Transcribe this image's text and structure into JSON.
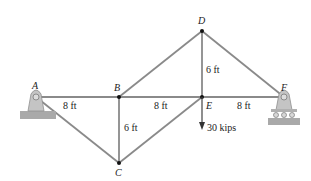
{
  "diagram": {
    "type": "truss",
    "nodes": [
      {
        "id": "A",
        "label": "A",
        "x": 36,
        "y": 97
      },
      {
        "id": "B",
        "label": "B",
        "x": 119,
        "y": 97
      },
      {
        "id": "C",
        "label": "C",
        "x": 119,
        "y": 163
      },
      {
        "id": "D",
        "label": "D",
        "x": 202,
        "y": 31
      },
      {
        "id": "E",
        "label": "E",
        "x": 202,
        "y": 97
      },
      {
        "id": "F",
        "label": "F",
        "x": 284,
        "y": 97
      }
    ],
    "members": [
      [
        "A",
        "B"
      ],
      [
        "B",
        "E"
      ],
      [
        "E",
        "F"
      ],
      [
        "A",
        "C"
      ],
      [
        "B",
        "C"
      ],
      [
        "C",
        "E"
      ],
      [
        "B",
        "D"
      ],
      [
        "D",
        "E"
      ],
      [
        "D",
        "F"
      ]
    ],
    "dimensions": {
      "AB": "8 ft",
      "BE": "8 ft",
      "EF": "8 ft",
      "BC": "6 ft",
      "DE": "6 ft"
    },
    "load": {
      "node": "E",
      "label": "30 kips",
      "direction": "down"
    },
    "supports": {
      "A": "pin",
      "F": "roller"
    },
    "colors": {
      "member": "#8a8a8a",
      "support": "#b9b9b9",
      "ground": "#9c9c9c",
      "node": "#111111"
    }
  }
}
